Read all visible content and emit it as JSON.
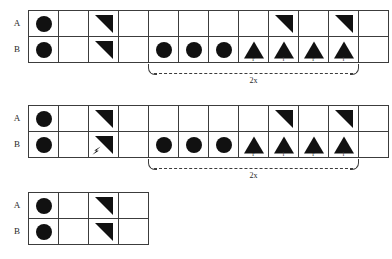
{
  "diagram": {
    "row_labels": {
      "top": "A",
      "bottom": "B"
    },
    "repeat_label": "2x",
    "blocks": [
      {
        "id": "block-1",
        "x": 8,
        "y": 10,
        "columns": 11,
        "rows": [
          {
            "label": "A",
            "cells": [
              {
                "shape": "circle"
              },
              {
                "shape": "empty"
              },
              {
                "shape": "triangle-down-left"
              },
              {
                "shape": "empty"
              },
              {
                "shape": "empty"
              },
              {
                "shape": "empty"
              },
              {
                "shape": "empty"
              },
              {
                "shape": "empty"
              },
              {
                "shape": "triangle-down-left"
              },
              {
                "shape": "empty"
              },
              {
                "shape": "triangle-down-left"
              },
              {
                "shape": "empty"
              }
            ]
          },
          {
            "label": "B",
            "cells": [
              {
                "shape": "circle"
              },
              {
                "shape": "empty"
              },
              {
                "shape": "triangle-down-left"
              },
              {
                "shape": "empty"
              },
              {
                "shape": "circle"
              },
              {
                "shape": "circle"
              },
              {
                "shape": "circle"
              },
              {
                "shape": "triangle-up",
                "label": "r"
              },
              {
                "shape": "triangle-up",
                "label": "l"
              },
              {
                "shape": "triangle-up",
                "label": "r"
              },
              {
                "shape": "triangle-up",
                "label": "l"
              },
              {
                "shape": "empty"
              }
            ]
          }
        ],
        "bracket": {
          "start_column": 5,
          "end_column": 11,
          "label": "2x"
        }
      },
      {
        "id": "block-2",
        "x": 8,
        "y": 105,
        "columns": 11,
        "rows": [
          {
            "label": "A",
            "cells": [
              {
                "shape": "circle"
              },
              {
                "shape": "empty"
              },
              {
                "shape": "triangle-down-left"
              },
              {
                "shape": "empty"
              },
              {
                "shape": "empty"
              },
              {
                "shape": "empty"
              },
              {
                "shape": "empty"
              },
              {
                "shape": "empty"
              },
              {
                "shape": "triangle-down-left"
              },
              {
                "shape": "empty"
              },
              {
                "shape": "triangle-down-left"
              },
              {
                "shape": "empty"
              }
            ]
          },
          {
            "label": "B",
            "cells": [
              {
                "shape": "circle"
              },
              {
                "shape": "empty"
              },
              {
                "shape": "triangle-down-left",
                "accent": "arrow"
              },
              {
                "shape": "empty"
              },
              {
                "shape": "circle"
              },
              {
                "shape": "circle"
              },
              {
                "shape": "circle"
              },
              {
                "shape": "triangle-up",
                "label": "r"
              },
              {
                "shape": "triangle-up",
                "label": "l"
              },
              {
                "shape": "triangle-up",
                "label": "r"
              },
              {
                "shape": "triangle-up",
                "label": "l"
              },
              {
                "shape": "empty"
              }
            ]
          }
        ],
        "bracket": {
          "start_column": 5,
          "end_column": 11,
          "label": "2x"
        }
      },
      {
        "id": "block-3",
        "x": 8,
        "y": 192,
        "columns": 4,
        "rows": [
          {
            "label": "A",
            "cells": [
              {
                "shape": "circle"
              },
              {
                "shape": "empty"
              },
              {
                "shape": "triangle-down-left"
              },
              {
                "shape": "empty"
              }
            ]
          },
          {
            "label": "B",
            "cells": [
              {
                "shape": "circle"
              },
              {
                "shape": "empty"
              },
              {
                "shape": "triangle-down-left"
              },
              {
                "shape": "empty"
              }
            ]
          }
        ],
        "bracket": null
      }
    ]
  },
  "colors": {
    "ink": "#111111",
    "rule": "#3c3c3c",
    "background": "#ffffff"
  }
}
